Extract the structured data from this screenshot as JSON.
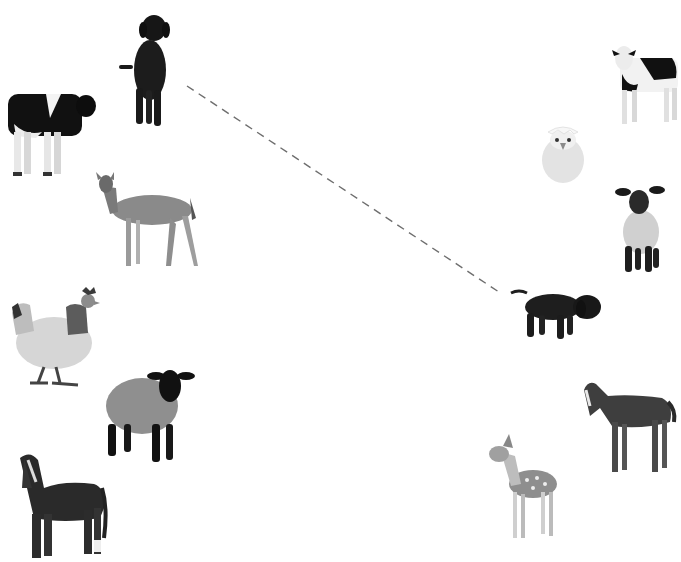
{
  "worksheet": {
    "left_column": [
      {
        "id": "dog",
        "label": "dog",
        "x": 116,
        "y": 10,
        "w": 64,
        "h": 118
      },
      {
        "id": "cow",
        "label": "cow",
        "x": 6,
        "y": 88,
        "w": 92,
        "h": 92
      },
      {
        "id": "deer",
        "label": "deer",
        "x": 88,
        "y": 168,
        "w": 112,
        "h": 104
      },
      {
        "id": "hen",
        "label": "hen",
        "x": 8,
        "y": 285,
        "w": 92,
        "h": 104
      },
      {
        "id": "sheep",
        "label": "sheep",
        "x": 104,
        "y": 368,
        "w": 90,
        "h": 98
      },
      {
        "id": "horse",
        "label": "horse",
        "x": 14,
        "y": 448,
        "w": 94,
        "h": 112
      }
    ],
    "right_column": [
      {
        "id": "calf",
        "label": "calf",
        "x": 610,
        "y": 44,
        "w": 70,
        "h": 84
      },
      {
        "id": "chick",
        "label": "chick in egg",
        "x": 540,
        "y": 122,
        "w": 46,
        "h": 62
      },
      {
        "id": "lamb",
        "label": "lamb",
        "x": 615,
        "y": 184,
        "w": 50,
        "h": 90
      },
      {
        "id": "puppy",
        "label": "puppy",
        "x": 511,
        "y": 289,
        "w": 92,
        "h": 52
      },
      {
        "id": "foal",
        "label": "foal",
        "x": 582,
        "y": 376,
        "w": 94,
        "h": 100
      },
      {
        "id": "fawn",
        "label": "fawn",
        "x": 487,
        "y": 432,
        "w": 72,
        "h": 110
      }
    ],
    "connections": [
      {
        "from": "dog",
        "to": "puppy",
        "x1": 187,
        "y1": 86,
        "x2": 502,
        "y2": 294,
        "style": "dashed",
        "color": "#6e6e6e"
      }
    ]
  }
}
